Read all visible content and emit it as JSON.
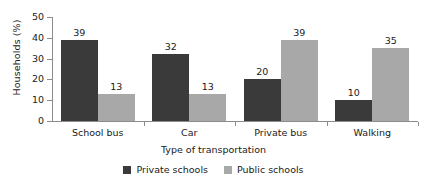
{
  "chart_data": {
    "type": "bar",
    "title": "",
    "xlabel": "Type of transportation",
    "ylabel": "Households (%)",
    "categories": [
      "School bus",
      "Car",
      "Private bus",
      "Walking"
    ],
    "series": [
      {
        "name": "Private schools",
        "color": "#3a3a3a",
        "values": [
          39,
          32,
          20,
          10
        ]
      },
      {
        "name": "Public schools",
        "color": "#a8a8a8",
        "values": [
          13,
          13,
          39,
          35
        ]
      }
    ],
    "ylim": [
      0,
      50
    ],
    "yticks": [
      0,
      10,
      20,
      30,
      40,
      50
    ],
    "grid": false,
    "legend_position": "bottom",
    "value_labels": true
  },
  "legend": {
    "items": [
      {
        "label": "Private schools",
        "color": "#3a3a3a"
      },
      {
        "label": "Public schools",
        "color": "#a8a8a8"
      }
    ]
  },
  "axis": {
    "y_title": "Households (%)",
    "x_title": "Type of transportation",
    "y_tick_labels": [
      "50",
      "40",
      "30",
      "20",
      "10",
      "0"
    ]
  },
  "colors": {
    "axis": "#8c8c8c",
    "text": "#1a1a1a",
    "background": "#ffffff",
    "series_private": "#3a3a3a",
    "series_public": "#a8a8a8"
  }
}
